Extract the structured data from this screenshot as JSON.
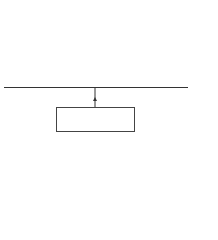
{
  "chart_data": {
    "type": "bar",
    "title": "",
    "xlabel": "p̂1 − p̂2",
    "ylabel": "",
    "bar_relative_heights": [
      1.0,
      1.7,
      2.4,
      5.3,
      8.4,
      13.3,
      16.6,
      19.9,
      16.6,
      13.3,
      8.4,
      5.3,
      2.4,
      1.7,
      1.0
    ],
    "annotation": "Mean = p1 − p2",
    "grid": false
  },
  "diagram": {
    "axis_label_parts": {
      "p1": "p̂",
      "sub1": "1",
      "minus": "−",
      "p2": "p̂",
      "sub2": "2"
    },
    "mean_box": {
      "prefix": "Mean = ",
      "p1": "p",
      "sub1": "1",
      "minus": " − ",
      "p2": "p",
      "sub2": "2"
    }
  }
}
